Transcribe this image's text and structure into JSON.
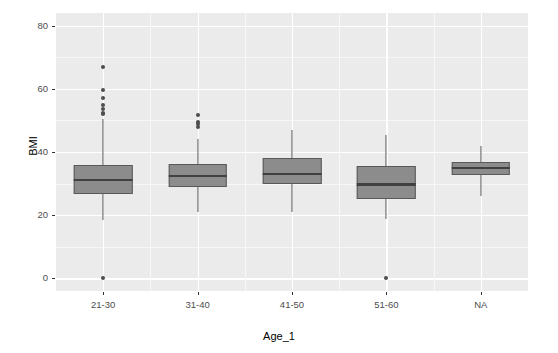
{
  "chart_data": {
    "type": "box",
    "title": "",
    "xlabel": "Age_1",
    "ylabel": "BMI",
    "ylim": [
      -4,
      84
    ],
    "yticks": [
      0,
      20,
      40,
      60,
      80
    ],
    "ytick_labels": [
      "0",
      "20",
      "40",
      "60",
      "80"
    ],
    "y_minor_ticks": [
      10,
      30,
      50,
      70
    ],
    "categories": [
      "21-30",
      "31-40",
      "41-50",
      "51-60",
      "NA"
    ],
    "grid": "major-and-minor-white-on-grey",
    "legend": "none",
    "theme": "ggplot2-grey",
    "box_fill": "#8c8c8c",
    "box_border": "#595959",
    "median_color": "#404040",
    "panel_background": "#ebebeb",
    "plot_background": "#ffffff",
    "boxes": [
      {
        "category": "21-30",
        "whisker_low": 18.5,
        "q1": 26.6,
        "median": 31.2,
        "q3": 36.0,
        "whisker_high": 50.3,
        "outliers": [
          67.0,
          59.5,
          57.0,
          55.0,
          53.5,
          52.5,
          52.0,
          0.0
        ]
      },
      {
        "category": "31-40",
        "whisker_low": 21.0,
        "q1": 28.8,
        "median": 32.4,
        "q3": 36.1,
        "whisker_high": 44.2,
        "outliers": [
          51.8,
          49.5,
          48.8,
          48.0
        ]
      },
      {
        "category": "41-50",
        "whisker_low": 21.0,
        "q1": 30.0,
        "median": 33.0,
        "q3": 38.0,
        "whisker_high": 47.0,
        "outliers": []
      },
      {
        "category": "51-60",
        "whisker_low": 18.7,
        "q1": 25.0,
        "median": 29.7,
        "q3": 35.5,
        "whisker_high": 45.5,
        "outliers": [
          0.0
        ]
      },
      {
        "category": "NA",
        "whisker_low": 26.0,
        "q1": 32.6,
        "median": 35.0,
        "q3": 36.8,
        "whisker_high": 42.0,
        "outliers": []
      }
    ]
  },
  "axes": {
    "y_title": "BMI",
    "x_title": "Age_1",
    "y_tick_labels": [
      "80",
      "60",
      "40",
      "20",
      "0"
    ],
    "x_tick_labels": [
      "21-30",
      "31-40",
      "41-50",
      "51-60",
      "NA"
    ]
  }
}
